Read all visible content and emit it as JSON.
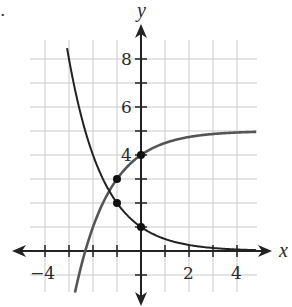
{
  "chart_data": {
    "type": "line",
    "title": "",
    "xlabel": "x",
    "ylabel": "y",
    "xlim": [
      -4.5,
      5
    ],
    "ylim": [
      -2,
      9.5
    ],
    "grid": true,
    "x_tick_labels": [
      "-4",
      "2",
      "4"
    ],
    "y_tick_labels": [
      "4",
      "6",
      "8"
    ],
    "series": [
      {
        "name": "increasing curve",
        "description": "approaches horizontal asymptote y = 5",
        "equation_estimate": "y = 5 - 2^(-x)",
        "x": [
          -3.1,
          -2.32,
          -2,
          -1,
          0,
          1,
          2,
          3,
          4,
          4.8
        ],
        "y": [
          -1.6,
          0,
          1,
          3,
          4,
          4.5,
          4.75,
          4.875,
          4.94,
          4.96
        ]
      },
      {
        "name": "decreasing curve",
        "description": "approaches horizontal asymptote y = 0",
        "equation_estimate": "y = 2^(-x)",
        "x": [
          -3.1,
          -3,
          -2,
          -1,
          0,
          1,
          2,
          3,
          4,
          4.8
        ],
        "y": [
          8.6,
          8,
          4,
          2,
          1,
          0.5,
          0.25,
          0.125,
          0.06,
          0.04
        ]
      }
    ],
    "marked_points": [
      {
        "x": -1,
        "y": 3
      },
      {
        "x": -1,
        "y": 2
      },
      {
        "x": 0,
        "y": 1
      },
      {
        "x": 0,
        "y": 4
      }
    ]
  },
  "labels": {
    "x_axis": "x",
    "y_axis": "y",
    "xt_neg4": "−4",
    "xt_2": "2",
    "xt_4": "4",
    "yt_4": "4",
    "yt_6": "6",
    "yt_8": "8",
    "bullet": "."
  }
}
